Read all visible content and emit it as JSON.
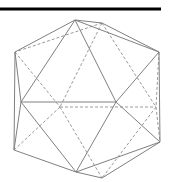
{
  "figure": {
    "colors": {
      "bar": "#000000",
      "solid_edge": "#808080",
      "hidden_edge": "#9a9a9a",
      "background": "#ffffff"
    },
    "top_rule": {
      "x1": 0,
      "y1": 9,
      "x2": 161,
      "y2": 9
    },
    "vertices": {
      "A": [
        75,
        20
      ],
      "B": [
        102,
        23
      ],
      "C": [
        15,
        52
      ],
      "D": [
        159,
        52
      ],
      "E": [
        21,
        102
      ],
      "F": [
        116,
        102
      ],
      "K": [
        60,
        107
      ],
      "L": [
        156,
        107
      ],
      "G": [
        14,
        150
      ],
      "H": [
        160,
        142
      ],
      "I": [
        76,
        172
      ],
      "J": [
        102,
        178
      ]
    },
    "solid_edges": [
      [
        "A",
        "B"
      ],
      [
        "A",
        "C"
      ],
      [
        "B",
        "D"
      ],
      [
        "A",
        "D"
      ],
      [
        "C",
        "E"
      ],
      [
        "C",
        "G"
      ],
      [
        "A",
        "E"
      ],
      [
        "A",
        "F"
      ],
      [
        "D",
        "F"
      ],
      [
        "D",
        "H"
      ],
      [
        "E",
        "F"
      ],
      [
        "E",
        "G"
      ],
      [
        "E",
        "I"
      ],
      [
        "F",
        "I"
      ],
      [
        "F",
        "H"
      ],
      [
        "G",
        "I"
      ],
      [
        "H",
        "I"
      ],
      [
        "H",
        "J"
      ],
      [
        "I",
        "J"
      ]
    ],
    "dashed_edges": [
      [
        "B",
        "C"
      ],
      [
        "B",
        "K"
      ],
      [
        "B",
        "L"
      ],
      [
        "C",
        "K"
      ],
      [
        "D",
        "L"
      ],
      [
        "K",
        "L"
      ],
      [
        "K",
        "G"
      ],
      [
        "K",
        "J"
      ],
      [
        "L",
        "J"
      ],
      [
        "L",
        "H"
      ]
    ]
  }
}
